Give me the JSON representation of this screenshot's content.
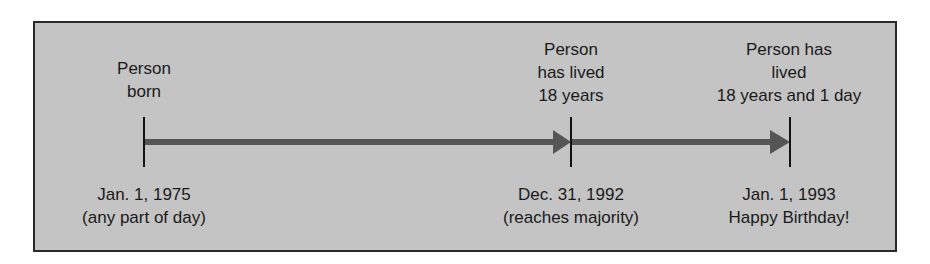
{
  "diagram": {
    "title": "",
    "colors": {
      "background": "#c4c4c4",
      "border": "#2a2a2a",
      "arrow": "#555555",
      "tick": "#111111",
      "text": "#1a1a1a"
    },
    "events": [
      {
        "id": "born",
        "top_lines": [
          "Person",
          "born"
        ],
        "bottom_lines": [
          "Jan. 1, 1975",
          "(any part of day)"
        ]
      },
      {
        "id": "majority",
        "top_lines": [
          "Person",
          "has lived",
          "18 years"
        ],
        "bottom_lines": [
          "Dec. 31, 1992",
          "(reaches majority)"
        ]
      },
      {
        "id": "birthday",
        "top_lines": [
          "Person has",
          "lived",
          "18 years and 1 day"
        ],
        "bottom_lines": [
          "Jan. 1, 1993",
          "Happy Birthday!"
        ]
      }
    ],
    "arrows": [
      {
        "from": "born",
        "to": "majority"
      },
      {
        "from": "majority",
        "to": "birthday"
      }
    ]
  }
}
